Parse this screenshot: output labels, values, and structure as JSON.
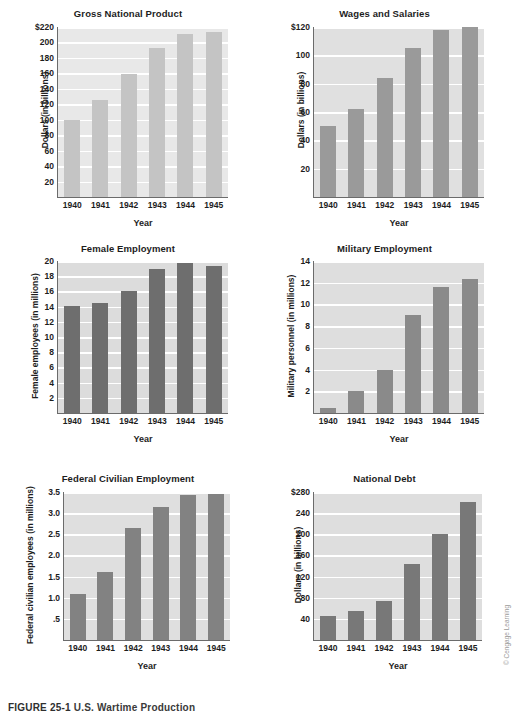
{
  "figure": {
    "caption_label": "FIGURE 25-1",
    "caption_text": "U.S. Wartime Production",
    "credit": "© Cengage Learning"
  },
  "chart_data": [
    {
      "type": "bar",
      "title": "Gross National Product",
      "xlabel": "Year",
      "ylabel": "Dollars (in billions)",
      "categories": [
        "1940",
        "1941",
        "1942",
        "1943",
        "1944",
        "1945"
      ],
      "values": [
        100,
        126,
        159,
        193,
        211,
        213
      ],
      "yticks": [
        "20",
        "40",
        "60",
        "80",
        "100",
        "120",
        "140",
        "160",
        "180",
        "200",
        "$220"
      ],
      "ytick_values": [
        20,
        40,
        60,
        80,
        100,
        120,
        140,
        160,
        180,
        200,
        220
      ],
      "ylim": [
        0,
        220
      ],
      "grid": true,
      "legend": "none",
      "bar_color": "#c4c4c4",
      "plot_bg": "#e8e8e8"
    },
    {
      "type": "bar",
      "title": "Wages and Salaries",
      "xlabel": "Year",
      "ylabel": "Dollars (in billions)",
      "categories": [
        "1940",
        "1941",
        "1942",
        "1943",
        "1944",
        "1945"
      ],
      "values": [
        50,
        62,
        84,
        105,
        118,
        120
      ],
      "yticks": [
        "20",
        "40",
        "60",
        "80",
        "100",
        "$120"
      ],
      "ytick_values": [
        20,
        40,
        60,
        80,
        100,
        120
      ],
      "ylim": [
        0,
        120
      ],
      "grid": true,
      "legend": "none",
      "bar_color": "#9a9a9a",
      "plot_bg": "#e0e0e0"
    },
    {
      "type": "bar",
      "title": "Female Employment",
      "xlabel": "Year",
      "ylabel": "Female employees (in millions)",
      "categories": [
        "1940",
        "1941",
        "1942",
        "1943",
        "1944",
        "1945"
      ],
      "values": [
        14.1,
        14.5,
        16.1,
        19.0,
        19.8,
        19.3
      ],
      "yticks": [
        "2",
        "4",
        "6",
        "8",
        "10",
        "12",
        "14",
        "16",
        "18",
        "20"
      ],
      "ytick_values": [
        2,
        4,
        6,
        8,
        10,
        12,
        14,
        16,
        18,
        20
      ],
      "ylim": [
        0,
        20
      ],
      "grid": true,
      "legend": "none",
      "bar_color": "#6e6e6e",
      "plot_bg": "#dcdcdc"
    },
    {
      "type": "bar",
      "title": "Military Employment",
      "xlabel": "Year",
      "ylabel": "Military personnel (in millions)",
      "categories": [
        "1940",
        "1941",
        "1942",
        "1943",
        "1944",
        "1945"
      ],
      "values": [
        0.5,
        2.0,
        4.0,
        9.0,
        11.6,
        12.3
      ],
      "yticks": [
        "2",
        "4",
        "6",
        "8",
        "10",
        "12",
        "14"
      ],
      "ytick_values": [
        2,
        4,
        6,
        8,
        10,
        12,
        14
      ],
      "ylim": [
        0,
        14
      ],
      "grid": true,
      "legend": "none",
      "bar_color": "#8a8a8a",
      "plot_bg": "#dedede"
    },
    {
      "type": "bar",
      "title": "Federal Civilian Employment",
      "xlabel": "Year",
      "ylabel": "Federal civilian employees (in millions)",
      "categories": [
        "1940",
        "1941",
        "1942",
        "1943",
        "1944",
        "1945"
      ],
      "values": [
        1.1,
        1.6,
        2.65,
        3.15,
        3.42,
        3.46
      ],
      "yticks": [
        ".5",
        "1.0",
        "1.5",
        "2.0",
        "2.5",
        "3.0",
        "3.5"
      ],
      "ytick_values": [
        0.5,
        1.0,
        1.5,
        2.0,
        2.5,
        3.0,
        3.5
      ],
      "ylim": [
        0,
        3.5
      ],
      "grid": true,
      "legend": "none",
      "bar_color": "#828282",
      "plot_bg": "#dfdfdf"
    },
    {
      "type": "bar",
      "title": "National Debt",
      "xlabel": "Year",
      "ylabel": "Dollars (in billions)",
      "categories": [
        "1940",
        "1941",
        "1942",
        "1943",
        "1944",
        "1945"
      ],
      "values": [
        45,
        55,
        73,
        143,
        201,
        261
      ],
      "yticks": [
        "40",
        "80",
        "120",
        "160",
        "200",
        "240",
        "$280"
      ],
      "ytick_values": [
        40,
        80,
        120,
        160,
        200,
        240,
        280
      ],
      "ylim": [
        0,
        280
      ],
      "grid": true,
      "legend": "none",
      "bar_color": "#787878",
      "plot_bg": "#dedede"
    }
  ]
}
